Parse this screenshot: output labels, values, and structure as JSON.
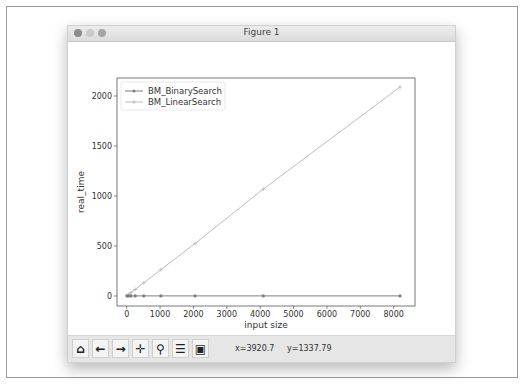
{
  "window": {
    "title": "Figure 1"
  },
  "toolbar": {
    "buttons": [
      {
        "name": "home",
        "icon": "home-icon",
        "glyph": "⌂"
      },
      {
        "name": "back",
        "icon": "arrow-left-icon",
        "glyph": "←"
      },
      {
        "name": "forward",
        "icon": "arrow-right-icon",
        "glyph": "→"
      },
      {
        "name": "pan",
        "icon": "move-icon",
        "glyph": "✛"
      },
      {
        "name": "zoom",
        "icon": "magnifier-icon",
        "glyph": "⚲"
      },
      {
        "name": "configure-subplots",
        "icon": "sliders-icon",
        "glyph": "☰"
      },
      {
        "name": "save",
        "icon": "floppy-disk-icon",
        "glyph": "▣"
      }
    ],
    "coord_x": "x=3920.7",
    "coord_y": "y=1337.79"
  },
  "chart_data": {
    "type": "line",
    "title": "",
    "xlabel": "input size",
    "ylabel": "real_time",
    "xlim": [
      -290,
      8640
    ],
    "ylim": [
      -100,
      2180
    ],
    "xticks": [
      0,
      1000,
      2000,
      3000,
      4000,
      5000,
      6000,
      7000,
      8000
    ],
    "yticks": [
      0,
      500,
      1000,
      1500,
      2000
    ],
    "grid": false,
    "legend_position": "upper left",
    "x": [
      8,
      64,
      128,
      256,
      512,
      1024,
      2048,
      4096,
      8192
    ],
    "series": [
      {
        "name": "BM_BinarySearch",
        "color": "#7f7f7f",
        "marker": "o",
        "values": [
          1,
          1,
          1,
          1,
          1,
          1,
          1,
          1,
          1
        ]
      },
      {
        "name": "BM_LinearSearch",
        "color": "#bdbdbd",
        "marker": "+",
        "values": [
          2,
          17,
          33,
          66,
          131,
          263,
          525,
          1070,
          2090
        ]
      }
    ]
  }
}
